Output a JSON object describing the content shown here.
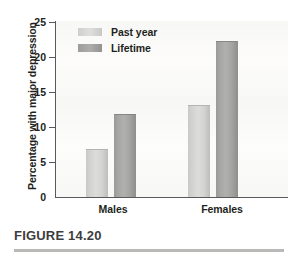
{
  "figure": {
    "caption": "FIGURE 14.20"
  },
  "chart_data": {
    "type": "bar",
    "title": "",
    "xlabel": "",
    "ylabel": "Percentage with major depression",
    "categories": [
      "Males",
      "Females"
    ],
    "series": [
      {
        "name": "Past year",
        "values": [
          6.7,
          12.9
        ],
        "color": "#d6d6d4"
      },
      {
        "name": "Lifetime",
        "values": [
          11.7,
          22.0
        ],
        "color": "#a3a3a1"
      }
    ],
    "ylim": [
      0,
      25
    ],
    "yticks": [
      0,
      5,
      10,
      15,
      20,
      25
    ],
    "ytick_labels": [
      "0",
      "5",
      "10",
      "15",
      "20",
      "25"
    ],
    "grid": false,
    "legend_position": "top-left"
  }
}
